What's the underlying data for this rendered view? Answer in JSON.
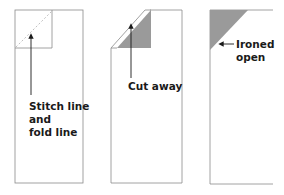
{
  "diagram": {
    "colors": {
      "outline": "#8a8a8a",
      "shade": "#9a9a9a",
      "stitch": "#c0c0c0",
      "arrow": "#1a1a1a",
      "text": "#1a1a1a"
    },
    "panels": [
      {
        "id": "step-1",
        "label": "Stitch line\nand\nfold line"
      },
      {
        "id": "step-2",
        "label": "Cut away"
      },
      {
        "id": "step-3",
        "label": "Ironed\nopen"
      }
    ]
  }
}
